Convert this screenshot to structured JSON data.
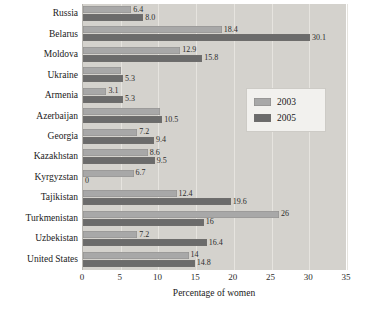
{
  "chart_data": {
    "type": "bar",
    "orientation": "horizontal",
    "title": "",
    "xlabel": "Percentage of women",
    "ylabel": "",
    "xlim": [
      0,
      35
    ],
    "xticks": [
      0,
      5,
      10,
      15,
      20,
      25,
      30,
      35
    ],
    "grid": true,
    "legend_position": "right-upper-inside",
    "categories": [
      "Russia",
      "Belarus",
      "Moldova",
      "Ukraine",
      "Armenia",
      "Azerbaijan",
      "Georgia",
      "Kazakhstan",
      "Kyrgyzstan",
      "Tajikistan",
      "Turkmenistan",
      "Uzbekistan",
      "United States"
    ],
    "series": [
      {
        "name": "2003",
        "color": "#a8a8a8",
        "values": [
          6.4,
          18.4,
          12.9,
          5.0,
          3.1,
          10.2,
          7.2,
          8.6,
          6.7,
          12.4,
          26,
          7.2,
          14
        ],
        "labels": [
          "6.4",
          "18.4",
          "12.9",
          "",
          "3.1",
          "",
          "7.2",
          "8.6",
          "6.7",
          "12.4",
          "26",
          "7.2",
          "14"
        ]
      },
      {
        "name": "2005",
        "color": "#6b6b6b",
        "values": [
          8.0,
          30.1,
          15.8,
          5.3,
          5.3,
          10.5,
          9.4,
          9.5,
          0,
          19.6,
          16,
          16.4,
          14.8
        ],
        "labels": [
          "8.0",
          "30.1",
          "15.8",
          "5.3",
          "5.3",
          "10.5",
          "9.4",
          "9.5",
          "0",
          "19.6",
          "16",
          "16.4",
          "14.8"
        ]
      }
    ]
  },
  "legend": {
    "items": [
      {
        "label": "2003"
      },
      {
        "label": "2005"
      }
    ]
  },
  "axis": {
    "x_label": "Percentage of women",
    "ticks": [
      "0",
      "5",
      "10",
      "15",
      "20",
      "25",
      "30",
      "35"
    ]
  },
  "figure": {
    "title": "",
    "caption": ""
  },
  "colors": {
    "series_2003": "#a8a8a8",
    "series_2005": "#6b6b6b",
    "plot_background": "#d4d2cd",
    "gridline": "#e6e4df",
    "legend_background": "#f2f1ee"
  }
}
